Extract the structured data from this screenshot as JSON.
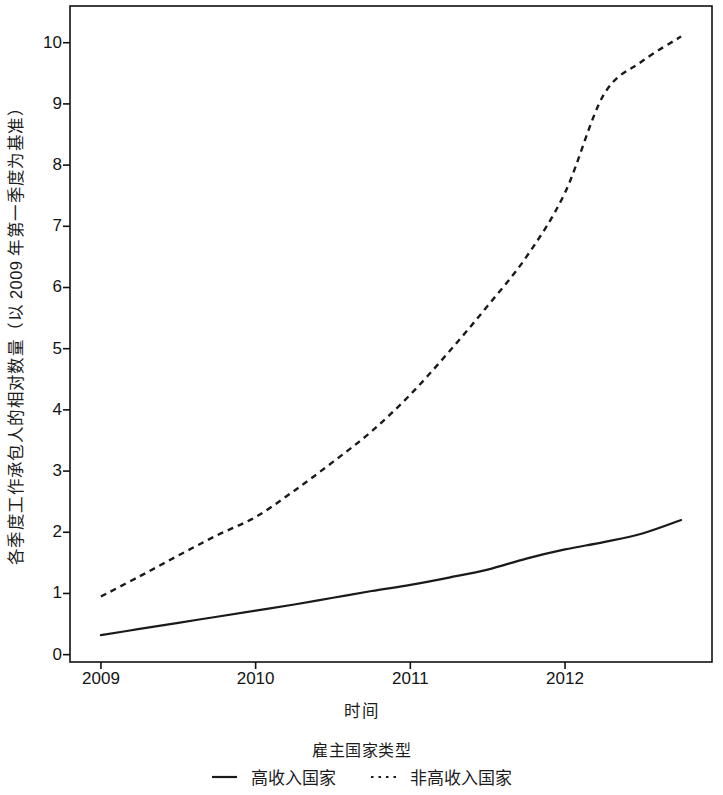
{
  "chart_data": {
    "type": "line",
    "title": "",
    "xlabel": "时间",
    "ylabel": "各季度工作承包人的相对数量（以 2009 年第一季度为基准）",
    "xlim": [
      2008.8,
      2012.95
    ],
    "ylim": [
      -0.12,
      10.6
    ],
    "xticks": [
      "2009",
      "2010",
      "2011",
      "2012"
    ],
    "xtick_values": [
      2009,
      2010,
      2011,
      2012
    ],
    "yticks": [
      "0",
      "1",
      "2",
      "3",
      "4",
      "5",
      "6",
      "7",
      "8",
      "9",
      "10"
    ],
    "ytick_values": [
      0,
      1,
      2,
      3,
      4,
      5,
      6,
      7,
      8,
      9,
      10
    ],
    "grid": false,
    "legend_position": "bottom",
    "legend_title": "雇主国家类型",
    "x": [
      2009.0,
      2009.25,
      2009.5,
      2009.75,
      2010.0,
      2010.25,
      2010.5,
      2010.75,
      2011.0,
      2011.25,
      2011.5,
      2011.75,
      2012.0,
      2012.25,
      2012.5,
      2012.75
    ],
    "series": [
      {
        "name": "高收入国家",
        "style": "solid",
        "color": "#1a1a1a",
        "values": [
          0.32,
          0.42,
          0.52,
          0.62,
          0.72,
          0.82,
          0.93,
          1.04,
          1.14,
          1.26,
          1.39,
          1.57,
          1.72,
          1.84,
          1.98,
          2.2
        ]
      },
      {
        "name": "非高收入国家",
        "style": "dotted",
        "color": "#1a1a1a",
        "values": [
          0.95,
          1.28,
          1.62,
          1.95,
          2.25,
          2.68,
          3.15,
          3.65,
          4.25,
          4.95,
          5.7,
          6.5,
          7.55,
          9.15,
          9.7,
          10.1
        ]
      }
    ]
  },
  "axes": {
    "x_title": "时间",
    "y_title": "各季度工作承包人的相对数量（以 2009 年第一季度为基准）"
  },
  "legend": {
    "title": "雇主国家类型",
    "entries": [
      {
        "label": "高收入国家",
        "style": "solid"
      },
      {
        "label": "非高收入国家",
        "style": "dotted"
      }
    ]
  }
}
